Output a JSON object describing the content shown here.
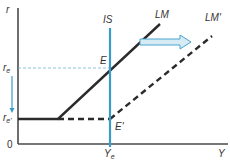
{
  "diagram": {
    "type": "IS-LM liquidity trap diagram",
    "axes": {
      "y_label": "r",
      "x_label": "Y",
      "origin_label": "0"
    },
    "levels": {
      "r_e": {
        "base": "r",
        "sub": "e"
      },
      "r_e_prime": {
        "base": "r",
        "sub": "e'"
      },
      "Y_e": {
        "base": "Y",
        "sub": "e"
      }
    },
    "curves": {
      "IS": "IS",
      "LM": "LM",
      "LM_prime": "LM'"
    },
    "points": {
      "E": "E",
      "E_prime": "E'"
    },
    "colors": {
      "axis": "#4a4a4a",
      "lm": "#2b2b2b",
      "is": "#3a9ac9",
      "arrow_fill": "#d7ebf5",
      "arrow_stroke": "#4aa3cf",
      "guide": "#6fb6d8"
    }
  }
}
